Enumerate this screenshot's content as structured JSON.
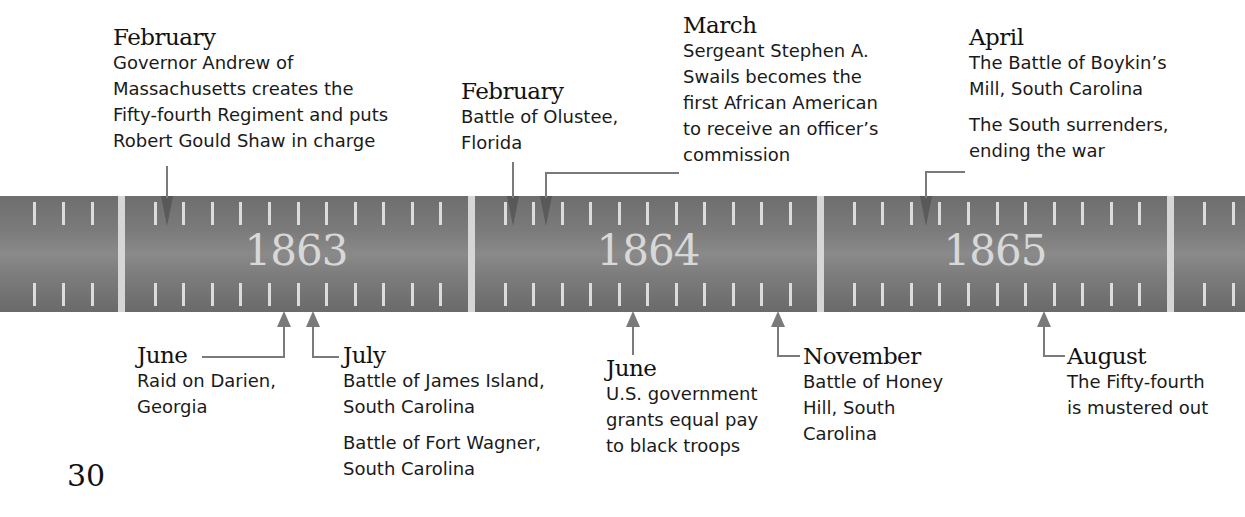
{
  "timeline": {
    "years": [
      {
        "label": "1863",
        "center_x": 296
      },
      {
        "label": "1864",
        "center_x": 648
      },
      {
        "label": "1865",
        "center_x": 995
      }
    ],
    "bar_color": "#7a7a7a",
    "tick_color": "#dcdcdc"
  },
  "events_above": [
    {
      "month": "February",
      "year": "1863",
      "lines": [
        "Governor Andrew of",
        "Massachusetts creates the",
        "Fifty-fourth Regiment and puts",
        "Robert Gould Shaw in charge"
      ]
    },
    {
      "month": "February",
      "year": "1864",
      "lines": [
        "Battle of Olustee,",
        "Florida"
      ]
    },
    {
      "month": "March",
      "year": "1864",
      "lines": [
        "Sergeant Stephen A.",
        "Swails becomes the",
        "first African American",
        "to receive an officer’s",
        "commission"
      ]
    },
    {
      "month": "April",
      "year": "1865",
      "lines": [
        "The Battle of Boykin’s",
        "Mill, South Carolina"
      ],
      "lines2": [
        "The South surrenders,",
        "ending the war"
      ]
    }
  ],
  "events_below": [
    {
      "month": "June",
      "year": "1863",
      "lines": [
        "Raid on Darien,",
        "Georgia"
      ]
    },
    {
      "month": "July",
      "year": "1863",
      "lines": [
        "Battle of James Island,",
        "South Carolina"
      ],
      "lines2": [
        "Battle of Fort Wagner,",
        "South Carolina"
      ]
    },
    {
      "month": "June",
      "year": "1864",
      "lines": [
        "U.S. government",
        "grants equal pay",
        "to black troops"
      ]
    },
    {
      "month": "November",
      "year": "1864",
      "lines": [
        "Battle of Honey",
        "Hill, South",
        "Carolina"
      ]
    },
    {
      "month": "August",
      "year": "1865",
      "lines": [
        "The Fifty-fourth",
        "is mustered out"
      ]
    }
  ],
  "page_number": "30"
}
